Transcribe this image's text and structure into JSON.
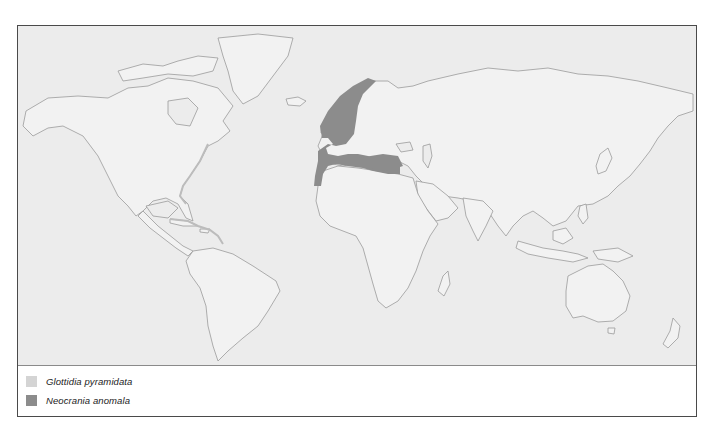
{
  "map": {
    "land_color": "#f1f1f1",
    "ocean_color": "#ececec",
    "coast_color": "#9a9a9a"
  },
  "legend": {
    "items": [
      {
        "label": "Glottidia pyramidata",
        "color": "#d4d4d4"
      },
      {
        "label": "Neocrania anomala",
        "color": "#8c8c8c"
      }
    ]
  }
}
